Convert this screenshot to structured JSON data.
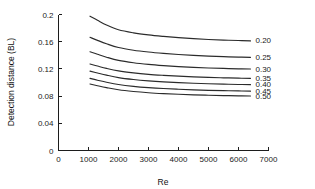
{
  "chart_data": {
    "type": "line",
    "title": "",
    "xlabel": "Re",
    "ylabel": "Detection distance (BL)",
    "xlim": [
      0,
      7000
    ],
    "ylim": [
      0,
      0.2
    ],
    "xticks": [
      0,
      1000,
      2000,
      3000,
      4000,
      5000,
      6000,
      7000
    ],
    "xtick_labels": [
      "0",
      "1000",
      "2000",
      "3000",
      "4000",
      "5000",
      "6000",
      "7000"
    ],
    "yticks": [
      0,
      0.04,
      0.08,
      0.12,
      0.16,
      0.2
    ],
    "ytick_labels": [
      "0",
      "0.04",
      "0.08",
      "0.12",
      "0.16",
      "0.2"
    ],
    "grid": false,
    "legend_position": "right-of-curve-ends",
    "line_color": "#2b2b2b",
    "x": [
      1050,
      1300,
      1600,
      2000,
      2500,
      3000,
      3500,
      4000,
      4500,
      5000,
      5500,
      6000,
      6400
    ],
    "series": [
      {
        "name": "0.20",
        "label": "0.20",
        "values": [
          0.1975,
          0.1915,
          0.1845,
          0.1775,
          0.173,
          0.17,
          0.1678,
          0.166,
          0.1645,
          0.1633,
          0.1624,
          0.1617,
          0.1612
        ]
      },
      {
        "name": "0.25",
        "label": "0.25",
        "values": [
          0.1665,
          0.162,
          0.157,
          0.1515,
          0.1475,
          0.1448,
          0.1428,
          0.1412,
          0.1399,
          0.1388,
          0.138,
          0.1374,
          0.137
        ]
      },
      {
        "name": "0.30",
        "label": "0.30",
        "values": [
          0.1452,
          0.1415,
          0.1372,
          0.1325,
          0.129,
          0.1266,
          0.1248,
          0.1234,
          0.1223,
          0.1214,
          0.1207,
          0.1201,
          0.1198
        ]
      },
      {
        "name": "0.35",
        "label": "0.35",
        "values": [
          0.1272,
          0.1242,
          0.1207,
          0.117,
          0.1141,
          0.112,
          0.1105,
          0.1093,
          0.1083,
          0.1075,
          0.1069,
          0.1064,
          0.1061
        ]
      },
      {
        "name": "0.40",
        "label": "0.40",
        "values": [
          0.1168,
          0.114,
          0.1108,
          0.1072,
          0.1044,
          0.1024,
          0.1009,
          0.0998,
          0.0989,
          0.0982,
          0.0976,
          0.0971,
          0.0968
        ]
      },
      {
        "name": "0.45",
        "label": "0.45",
        "values": [
          0.106,
          0.1034,
          0.1004,
          0.0971,
          0.0944,
          0.0925,
          0.0911,
          0.0901,
          0.0892,
          0.0885,
          0.088,
          0.0876,
          0.0873
        ]
      },
      {
        "name": "0.50",
        "label": "0.50",
        "values": [
          0.0978,
          0.0953,
          0.0925,
          0.0893,
          0.0868,
          0.085,
          0.0837,
          0.0827,
          0.0819,
          0.0813,
          0.0808,
          0.0804,
          0.0801
        ]
      }
    ]
  }
}
